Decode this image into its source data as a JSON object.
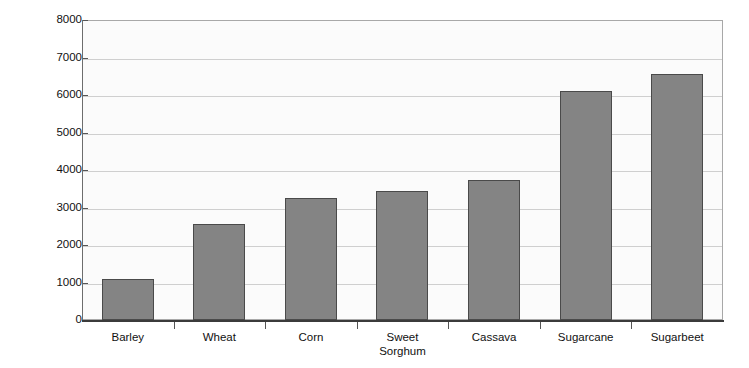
{
  "chart_data": {
    "type": "bar",
    "title": "",
    "xlabel": "",
    "ylabel": "Liters per hectare",
    "categories": [
      "Barley",
      "Wheat",
      "Corn",
      "Sweet\nSorghum",
      "Cassava",
      "Sugarcane",
      "Sugarbeet"
    ],
    "values": [
      1100,
      2560,
      3250,
      3430,
      3740,
      6100,
      6570
    ],
    "ylim": [
      0,
      8000
    ],
    "yticks": [
      0,
      1000,
      2000,
      3000,
      4000,
      5000,
      6000,
      7000,
      8000
    ],
    "ytick_labels": [
      "0",
      "1000",
      "2000",
      "3000",
      "4000",
      "5000",
      "6000",
      "7000",
      "8000"
    ],
    "grid": true,
    "legend": false,
    "bar_color": "#848484",
    "bar_edge_color": "#4a4a4a",
    "plot_background": "#fbfbfb",
    "gridline_color": "#cfcfcf",
    "axis_color": "#3b3b3b"
  }
}
